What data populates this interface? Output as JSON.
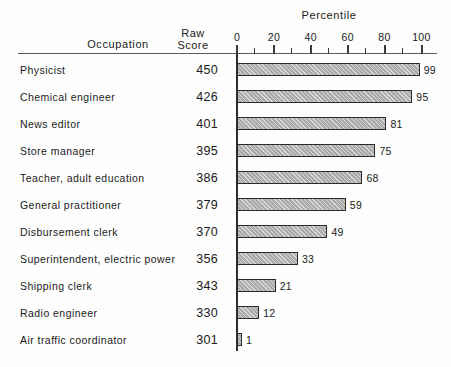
{
  "chart_data": {
    "type": "bar",
    "title": "",
    "xlabel": "Percentile",
    "ylabel": "Occupation",
    "orientation": "horizontal",
    "grid": false,
    "legend": "none",
    "xlim": [
      0,
      100
    ],
    "xticks": [
      0,
      10,
      20,
      30,
      40,
      50,
      60,
      70,
      80,
      90,
      100
    ],
    "xtick_labels": [
      "0",
      "",
      "20",
      "",
      "40",
      "",
      "60",
      "",
      "80",
      "",
      "100"
    ],
    "categories": [
      "Physicist",
      "Chemical engineer",
      "News editor",
      "Store manager",
      "Teacher, adult education",
      "General practitioner",
      "Disbursement clerk",
      "Superintendent, electric power",
      "Shipping clerk",
      "Radio engineer",
      "Air traffic coordinator"
    ],
    "values": [
      99,
      95,
      81,
      75,
      68,
      59,
      49,
      33,
      21,
      12,
      1
    ],
    "raw_scores": [
      450,
      426,
      401,
      395,
      386,
      379,
      370,
      356,
      343,
      330,
      301
    ],
    "series": [
      {
        "name": "Percentile",
        "values": [
          99,
          95,
          81,
          75,
          68,
          59,
          49,
          33,
          21,
          12,
          1
        ]
      }
    ],
    "bar_color": "#aaaaaa",
    "bar_edge_color": "#2b2b2b"
  },
  "headers": {
    "occupation": "Occupation",
    "raw_line1": "Raw",
    "raw_line2": "Score",
    "percentile": "Percentile"
  },
  "axis": {
    "tick_labels": [
      "0",
      "20",
      "40",
      "60",
      "80",
      "100"
    ],
    "tick_values": [
      0,
      20,
      40,
      60,
      80,
      100
    ]
  },
  "rows": [
    {
      "occupation": "Physicist",
      "raw_score": "450",
      "percentile": "99"
    },
    {
      "occupation": "Chemical engineer",
      "raw_score": "426",
      "percentile": "95"
    },
    {
      "occupation": "News editor",
      "raw_score": "401",
      "percentile": "81"
    },
    {
      "occupation": "Store manager",
      "raw_score": "395",
      "percentile": "75"
    },
    {
      "occupation": "Teacher, adult education",
      "raw_score": "386",
      "percentile": "68"
    },
    {
      "occupation": "General practitioner",
      "raw_score": "379",
      "percentile": "59"
    },
    {
      "occupation": "Disbursement clerk",
      "raw_score": "370",
      "percentile": "49"
    },
    {
      "occupation": "Superintendent, electric power",
      "raw_score": "356",
      "percentile": "33"
    },
    {
      "occupation": "Shipping clerk",
      "raw_score": "343",
      "percentile": "21"
    },
    {
      "occupation": "Radio engineer",
      "raw_score": "330",
      "percentile": "12"
    },
    {
      "occupation": "Air traffic coordinator",
      "raw_score": "301",
      "percentile": "1"
    }
  ]
}
